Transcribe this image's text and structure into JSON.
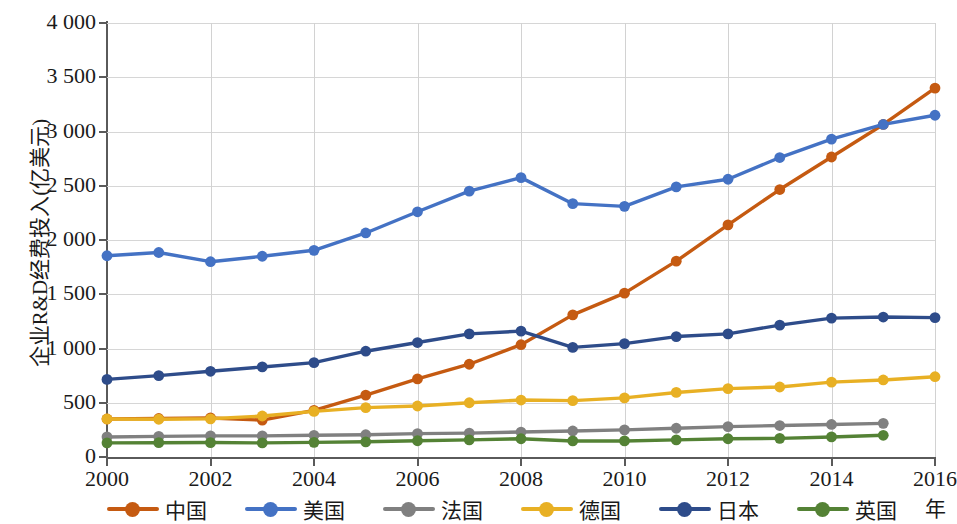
{
  "chart_data": {
    "type": "line",
    "title": "",
    "xlabel": "年",
    "ylabel": "企业R&D经费投入(亿美元)",
    "x": [
      2000,
      2001,
      2002,
      2003,
      2004,
      2005,
      2006,
      2007,
      2008,
      2009,
      2010,
      2011,
      2012,
      2013,
      2014,
      2015,
      2016
    ],
    "xlim": [
      2000,
      2016
    ],
    "ylim": [
      0,
      4000
    ],
    "xticks": [
      "2000",
      "2002",
      "2004",
      "2006",
      "2008",
      "2010",
      "2012",
      "2014",
      "2016"
    ],
    "yticks": [
      "0",
      "500",
      "1 000",
      "1 500",
      "2 000",
      "2 500",
      "3 000",
      "3 500",
      "4 000"
    ],
    "ytick_values": [
      0,
      500,
      1000,
      1500,
      2000,
      2500,
      3000,
      3500,
      4000
    ],
    "grid": true,
    "legend_position": "bottom",
    "series": [
      {
        "name": "中国",
        "color": "#C55A11",
        "values": [
          350,
          355,
          360,
          340,
          430,
          570,
          720,
          855,
          1035,
          1310,
          1510,
          1805,
          2140,
          2465,
          2765,
          3065,
          3400
        ]
      },
      {
        "name": "美国",
        "color": "#4472C4",
        "values": [
          1855,
          1885,
          1800,
          1850,
          1905,
          2065,
          2260,
          2450,
          2575,
          2335,
          2310,
          2490,
          2560,
          2760,
          2930,
          3065,
          3150
        ]
      },
      {
        "name": "法国",
        "color": "#808080",
        "values": [
          185,
          190,
          195,
          195,
          200,
          205,
          215,
          220,
          230,
          240,
          250,
          265,
          280,
          290,
          300,
          310,
          null
        ]
      },
      {
        "name": "德国",
        "color": "#E8B024",
        "values": [
          350,
          348,
          352,
          378,
          420,
          455,
          470,
          500,
          525,
          520,
          545,
          595,
          630,
          645,
          690,
          710,
          740
        ]
      },
      {
        "name": "日本",
        "color": "#2E4C8A",
        "values": [
          715,
          750,
          790,
          830,
          870,
          975,
          1055,
          1135,
          1160,
          1010,
          1045,
          1110,
          1135,
          1215,
          1280,
          1290,
          1285
        ]
      },
      {
        "name": "英国",
        "color": "#548235",
        "values": [
          130,
          132,
          133,
          130,
          135,
          140,
          150,
          158,
          168,
          148,
          148,
          158,
          168,
          172,
          185,
          200,
          null
        ]
      }
    ]
  },
  "legend": {
    "items": [
      {
        "label": "中国",
        "color": "#C55A11"
      },
      {
        "label": "美国",
        "color": "#4472C4"
      },
      {
        "label": "法国",
        "color": "#808080"
      },
      {
        "label": "德国",
        "color": "#E8B024"
      },
      {
        "label": "日本",
        "color": "#2E4C8A"
      },
      {
        "label": "英国",
        "color": "#548235"
      }
    ]
  }
}
